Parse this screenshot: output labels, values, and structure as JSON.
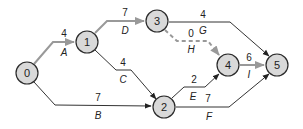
{
  "diagram": {
    "type": "activity-on-arrow network",
    "colors": {
      "critical": "#999999",
      "normal": "#333333",
      "node_fill": "#d9d9d9"
    },
    "nodes": [
      {
        "id": "0",
        "label": "0",
        "x": 27,
        "y": 73
      },
      {
        "id": "1",
        "label": "1",
        "x": 87,
        "y": 42
      },
      {
        "id": "2",
        "label": "2",
        "x": 164,
        "y": 107
      },
      {
        "id": "3",
        "label": "3",
        "x": 157,
        "y": 21
      },
      {
        "id": "4",
        "label": "4",
        "x": 228,
        "y": 65
      },
      {
        "id": "5",
        "label": "5",
        "x": 277,
        "y": 65
      }
    ],
    "edges": [
      {
        "activity": "A",
        "duration": "4",
        "from": "0",
        "to": "1",
        "critical": true
      },
      {
        "activity": "B",
        "duration": "7",
        "from": "0",
        "to": "2",
        "critical": false
      },
      {
        "activity": "C",
        "duration": "4",
        "from": "1",
        "to": "2",
        "critical": false
      },
      {
        "activity": "D",
        "duration": "7",
        "from": "1",
        "to": "3",
        "critical": true
      },
      {
        "activity": "E",
        "duration": "2",
        "from": "2",
        "to": "4",
        "critical": false
      },
      {
        "activity": "F",
        "duration": "7",
        "from": "2",
        "to": "5",
        "critical": false
      },
      {
        "activity": "G",
        "duration": "4",
        "from": "3",
        "to": "5",
        "critical": false
      },
      {
        "activity": "H",
        "duration": "0",
        "from": "3",
        "to": "4",
        "critical": true,
        "dummy": true
      },
      {
        "activity": "I",
        "duration": "6",
        "from": "4",
        "to": "5",
        "critical": true
      }
    ]
  }
}
